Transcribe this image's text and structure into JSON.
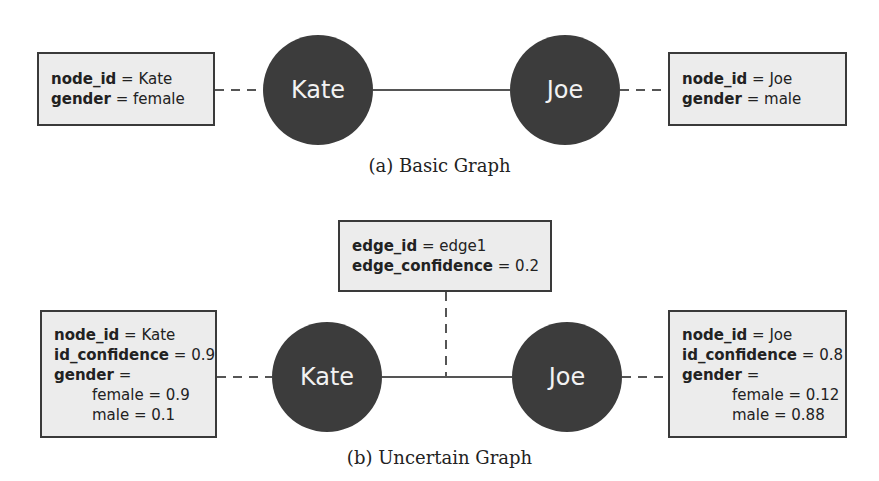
{
  "basic_graph": {
    "caption": "(a) Basic Graph",
    "nodes": [
      {
        "label": "Kate",
        "attributes": [
          {
            "key": "node_id",
            "eq": " = ",
            "value": "Kate"
          },
          {
            "key": "gender",
            "eq": " = ",
            "value": "female"
          }
        ]
      },
      {
        "label": "Joe",
        "attributes": [
          {
            "key": "node_id",
            "eq": " = ",
            "value": "Joe"
          },
          {
            "key": "gender",
            "eq": " = ",
            "value": "male"
          }
        ]
      }
    ]
  },
  "uncertain_graph": {
    "caption": "(b) Uncertain Graph",
    "edge": {
      "attributes": [
        {
          "key": "edge_id",
          "eq": " = ",
          "value": "edge1"
        },
        {
          "key": "edge_confidence",
          "eq": " = ",
          "value": "0.2"
        }
      ]
    },
    "nodes": [
      {
        "label": "Kate",
        "attributes": [
          {
            "key": "node_id",
            "eq": " = ",
            "value": "Kate"
          },
          {
            "key": "id_confidence",
            "eq": " = ",
            "value": "0.9"
          },
          {
            "key": "gender",
            "eq": " =",
            "value": ""
          }
        ],
        "distribution": [
          "female = 0.9",
          "male = 0.1"
        ]
      },
      {
        "label": "Joe",
        "attributes": [
          {
            "key": "node_id",
            "eq": " = ",
            "value": "Joe"
          },
          {
            "key": "id_confidence",
            "eq": " = ",
            "value": "0.8"
          },
          {
            "key": "gender",
            "eq": " =",
            "value": ""
          }
        ],
        "distribution": [
          "female = 0.12",
          "male = 0.88"
        ]
      }
    ]
  },
  "colors": {
    "node_fill": "#3c3c3c",
    "node_text": "#f2f2f2",
    "box_fill": "#ececec",
    "box_border": "#3a3a3a",
    "line": "#555555"
  }
}
